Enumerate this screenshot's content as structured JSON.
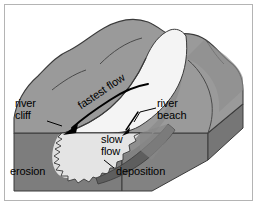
{
  "figure": {
    "background_color": "#ffffff",
    "border_color": "#b4b4b4"
  },
  "palette": {
    "hill_top": "#9a9a9a",
    "hill_shadow": "#8a8a8a",
    "block_side": "#7d7d7d",
    "block_front": "#808080",
    "water_light": "#f2f2f2",
    "water_submerged": "#d8d8d8",
    "deposition_band": "#5e5e5e",
    "outline": "#3a3a3a",
    "label_text": "#000000"
  },
  "labels": {
    "river_cliff": "river\ncliff",
    "river_beach": "river\nbeach",
    "fastest_flow": "fastest flow",
    "slow_flow": "slow\nflow",
    "erosion": "erosion",
    "deposition": "deposition"
  },
  "annotations": {
    "fastest_flow_arrow": "curved arrow along outer bend pointing down-left",
    "slow_flow_arrow": "short arrow pointing down-left into inner bend",
    "river_cliff_leader": "leader line from label to outer bank cliff",
    "river_beach_leader": "leader line from label to inner bank beach",
    "deposition_leader": "leader line from label up-left to sediment band"
  }
}
